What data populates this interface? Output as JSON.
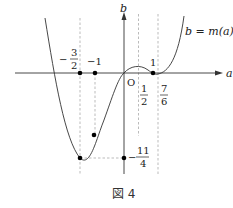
{
  "figure": {
    "caption": "図 4",
    "curve_label": "b = m(a)",
    "axes": {
      "x_label": "a",
      "y_label": "b",
      "origin_label": "O"
    },
    "tick_labels": {
      "neg_three_halves": {
        "sign": "−",
        "num": "3",
        "den": "2"
      },
      "neg_one": "−1",
      "one": "1",
      "one_half": {
        "num": "1",
        "den": "2"
      },
      "seven_sixths": {
        "num": "7",
        "den": "6"
      },
      "neg_eleven_fourths": {
        "sign": "−",
        "num": "11",
        "den": "4"
      }
    },
    "colors": {
      "curve": "#333333",
      "axis": "#333333",
      "dashed": "#aaaaaa",
      "point": "#000000"
    }
  }
}
